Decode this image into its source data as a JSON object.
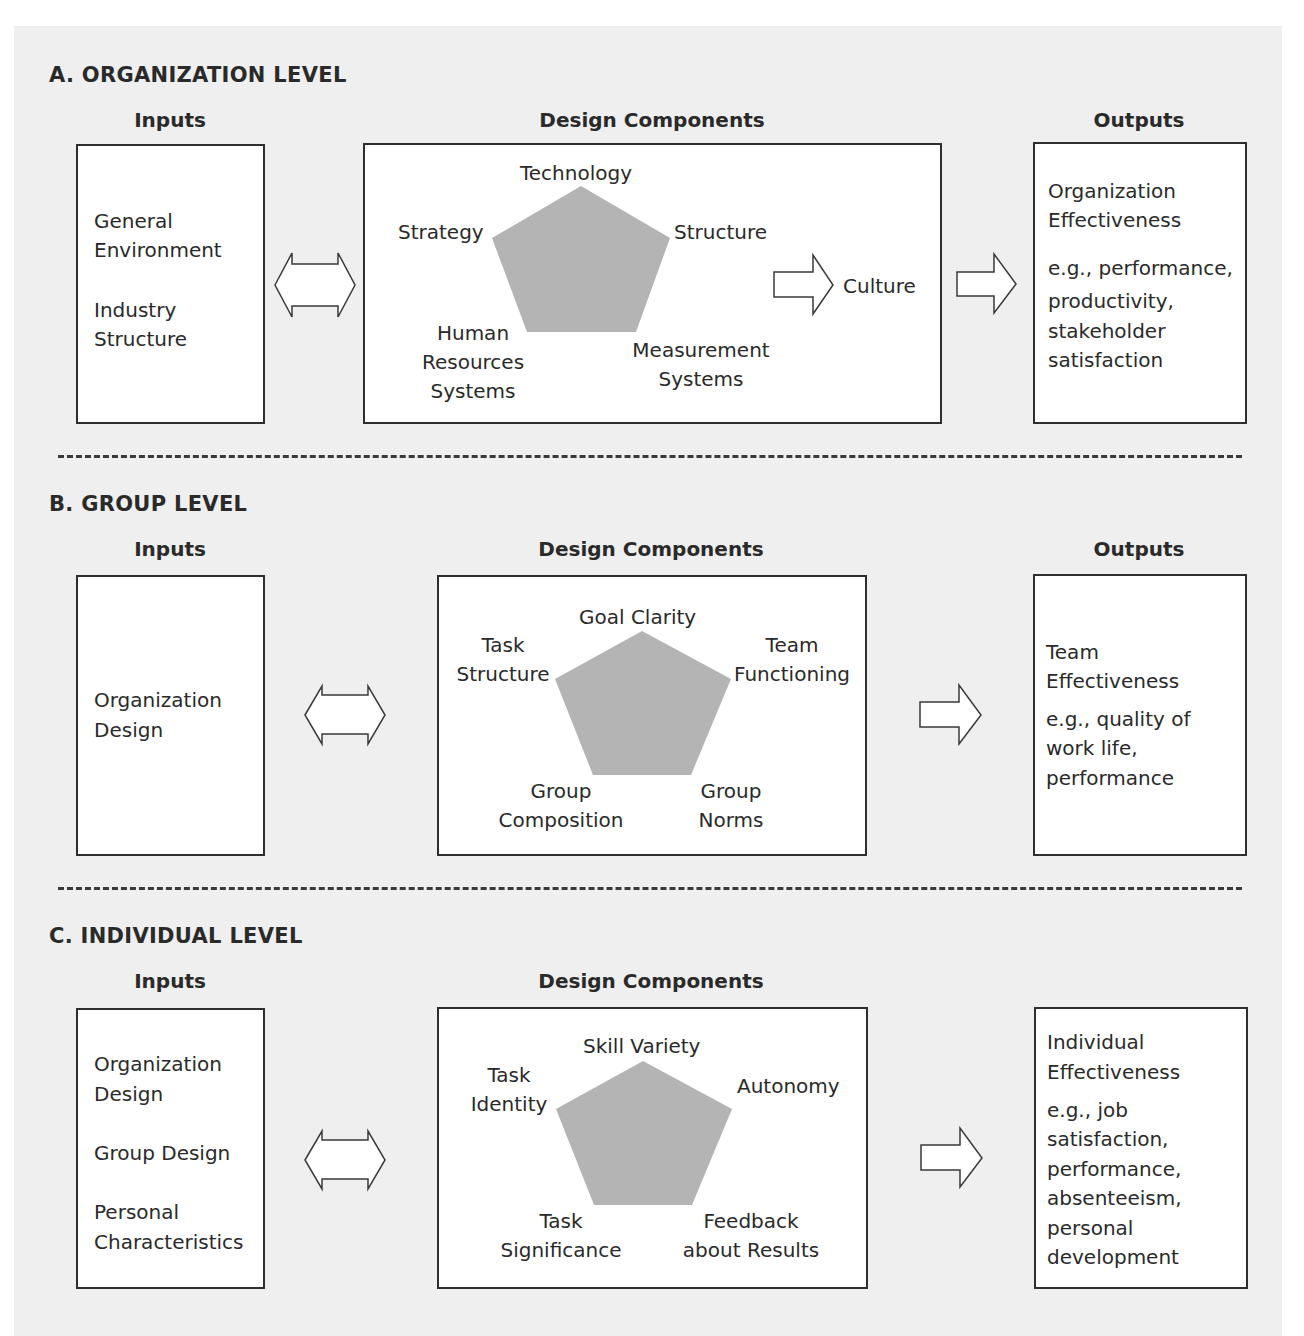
{
  "diagram": {
    "colors": {
      "panel_bg": "#efefef",
      "box_bg": "#ffffff",
      "border": "#2e2e2e",
      "pentagon_fill": "#b4b4b4",
      "text": "#2a2a2a"
    },
    "sections": [
      {
        "title": "A.  ORGANIZATION LEVEL",
        "inputs_header": "Inputs",
        "inputs": [
          "General",
          "Environment",
          "Industry",
          "Structure"
        ],
        "design_header": "Design Components",
        "components": {
          "top": "Technology",
          "left": "Strategy",
          "right": "Structure",
          "bottom_left": [
            "Human",
            "Resources",
            "Systems"
          ],
          "bottom_right": [
            "Measurement",
            "Systems"
          ]
        },
        "culture": "Culture",
        "outputs_header": "Outputs",
        "outputs": [
          "Organization",
          "Effectiveness",
          "e.g., performance,",
          "productivity,",
          "stakeholder",
          "satisfaction"
        ]
      },
      {
        "title": "B.  GROUP LEVEL",
        "inputs_header": "Inputs",
        "inputs": [
          "Organization",
          "Design"
        ],
        "design_header": "Design Components",
        "components": {
          "top": "Goal Clarity",
          "left": [
            "Task",
            "Structure"
          ],
          "right": [
            "Team",
            "Functioning"
          ],
          "bottom_left": [
            "Group",
            "Composition"
          ],
          "bottom_right": [
            "Group",
            "Norms"
          ]
        },
        "outputs_header": "Outputs",
        "outputs": [
          "Team",
          "Effectiveness",
          "e.g., quality of",
          "work life,",
          "performance"
        ]
      },
      {
        "title": "C.  INDIVIDUAL LEVEL",
        "inputs_header": "Inputs",
        "inputs": [
          "Organization",
          "Design",
          "Group Design",
          "Personal",
          "Characteristics"
        ],
        "design_header": "Design Components",
        "components": {
          "top": "Skill Variety",
          "left": [
            "Task",
            "Identity"
          ],
          "right": "Autonomy",
          "bottom_left": [
            "Task",
            "Significance"
          ],
          "bottom_right": [
            "Feedback",
            "about Results"
          ]
        },
        "outputs": [
          "Individual",
          "Effectiveness",
          "e.g., job",
          "satisfaction,",
          "performance,",
          "absenteeism,",
          "personal",
          "development"
        ]
      }
    ]
  }
}
